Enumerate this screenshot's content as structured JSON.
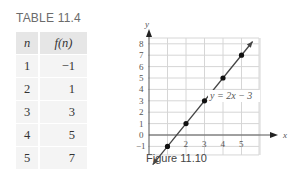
{
  "table": {
    "title": "TABLE 11.4",
    "headers": [
      "n",
      "f(n)"
    ],
    "rows": [
      [
        "1",
        "−1"
      ],
      [
        "2",
        "1"
      ],
      [
        "3",
        "3"
      ],
      [
        "4",
        "5"
      ],
      [
        "5",
        "7"
      ]
    ]
  },
  "figure": {
    "caption": "Figure 11.10",
    "equation_label": "y = 2x − 3",
    "x_axis_label": "x",
    "y_axis_label": "y"
  },
  "chart_data": {
    "type": "line",
    "title": "Figure 11.10",
    "xlabel": "x",
    "ylabel": "y",
    "x_ticks": [
      "2",
      "3",
      "4",
      "5"
    ],
    "y_ticks": [
      "-1",
      "0",
      "1",
      "2",
      "3",
      "4",
      "5",
      "6",
      "7",
      "8"
    ],
    "xlim": [
      0,
      6
    ],
    "ylim": [
      -2,
      8.5
    ],
    "grid": true,
    "series": [
      {
        "name": "y = 2x − 3",
        "x": [
          1,
          2,
          3,
          4,
          5
        ],
        "y": [
          -1,
          1,
          3,
          5,
          7
        ],
        "markers": true,
        "line_extends_both_ways": true
      }
    ],
    "annotations": [
      {
        "text": "y = 2x − 3",
        "x": 4.2,
        "y": 3.6
      }
    ]
  }
}
